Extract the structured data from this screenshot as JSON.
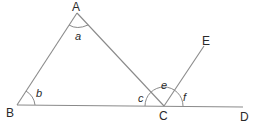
{
  "diagram": {
    "type": "geometry-angles",
    "points": {
      "A": {
        "label": "A",
        "x": 77,
        "y": 13
      },
      "B": {
        "label": "B",
        "x": 17,
        "y": 105
      },
      "C": {
        "label": "C",
        "x": 164,
        "y": 106
      },
      "D": {
        "label": "D",
        "x": 243,
        "y": 107
      },
      "E": {
        "label": "E",
        "x": 204,
        "y": 46
      }
    },
    "segments": [
      {
        "from": "A",
        "to": "B"
      },
      {
        "from": "A",
        "to": "C"
      },
      {
        "from": "B",
        "to": "D"
      },
      {
        "from": "C",
        "to": "E"
      }
    ],
    "angles": {
      "a": {
        "label": "a",
        "vertex": "A"
      },
      "b": {
        "label": "b",
        "vertex": "B"
      },
      "c": {
        "label": "c",
        "vertex": "C"
      },
      "e": {
        "label": "e",
        "vertex": "C"
      },
      "f": {
        "label": "f",
        "vertex": "C"
      }
    },
    "colors": {
      "line": "#8a8a8a",
      "text": "#2a2a2a",
      "background": "#ffffff"
    }
  }
}
